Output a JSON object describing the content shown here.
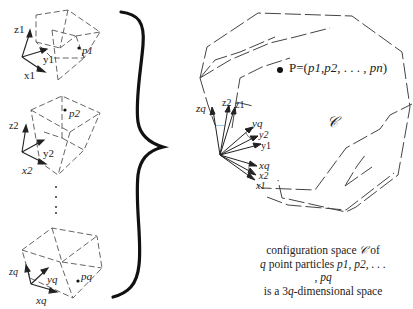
{
  "particles": [
    {
      "axes": {
        "z": "z1",
        "y": "y1",
        "x": "x1"
      },
      "point": "p1"
    },
    {
      "axes": {
        "z": "z2",
        "y": "y2",
        "x": "x2"
      },
      "point": "p2"
    },
    {
      "axes": {
        "z": "zq",
        "y": "yq",
        "x": "xq"
      },
      "point": "pq"
    }
  ],
  "ellipsis_vertical": "⋮",
  "config_space": {
    "symbol": "𝒞",
    "point_label": "P=(p1,p2, . . . , pn)",
    "point_label_parts": {
      "prefix": "P=(",
      "p1": "p1",
      "p2": "p2",
      "dots": ", . . . , ",
      "pn": "pn",
      "suffix": ")"
    },
    "origin_axes": {
      "z_labels": [
        "zq",
        "z2",
        "z1"
      ],
      "y_labels": [
        "yq",
        "y2",
        "y1"
      ],
      "x_labels": [
        "xq",
        "x2",
        "x1"
      ],
      "dots": "....."
    }
  },
  "caption": {
    "line1": "configuration space",
    "line1_symbol": "𝒞",
    "line1_end": "of",
    "line2_q": "q",
    "line2": "point particles",
    "line2_particles": "p1, p2, . . . , pq",
    "line3_pre": "is a 3",
    "line3_q": "q",
    "line3_post": "-dimensional space"
  },
  "colors": {
    "ink": "#222222",
    "dashed": "#555555",
    "brace": "#111111"
  }
}
